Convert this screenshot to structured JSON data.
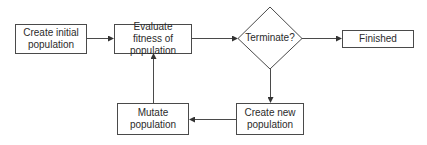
{
  "diagram": {
    "title": "",
    "nodes": [
      {
        "id": "create-initial",
        "label": "Create initial population",
        "shape": "rect"
      },
      {
        "id": "evaluate-fitness",
        "label": "Evaluate fitness of population",
        "shape": "rect"
      },
      {
        "id": "terminate",
        "label": "Terminate?",
        "shape": "diamond"
      },
      {
        "id": "finished",
        "label": "Finished",
        "shape": "rect"
      },
      {
        "id": "create-new",
        "label": "Create new population",
        "shape": "rect"
      },
      {
        "id": "mutate",
        "label": "Mutate population",
        "shape": "rect"
      }
    ],
    "edges": [
      {
        "from": "create-initial",
        "to": "evaluate-fitness"
      },
      {
        "from": "evaluate-fitness",
        "to": "terminate"
      },
      {
        "from": "terminate",
        "to": "finished"
      },
      {
        "from": "terminate",
        "to": "create-new"
      },
      {
        "from": "create-new",
        "to": "mutate"
      },
      {
        "from": "mutate",
        "to": "evaluate-fitness"
      }
    ],
    "colors": {
      "stroke": "#4a4a4a",
      "text": "#2b2b2b",
      "background": "#ffffff"
    }
  }
}
